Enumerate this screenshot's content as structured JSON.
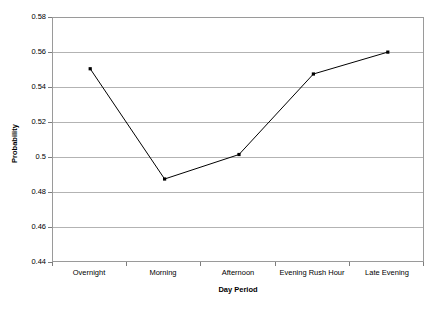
{
  "chart_data": {
    "type": "line",
    "title": "",
    "xlabel": "Day Period",
    "ylabel": "Probability",
    "categories": [
      "Overnight",
      "Morning",
      "Afternoon",
      "Evening Rush Hour",
      "Late Evening"
    ],
    "values": [
      0.551,
      0.488,
      0.502,
      0.548,
      0.5605
    ],
    "series": [
      {
        "name": "Probability",
        "values": [
          0.551,
          0.488,
          0.502,
          0.548,
          0.5605
        ]
      }
    ],
    "ylim": [
      0.44,
      0.58
    ],
    "ytick_step": 0.02,
    "ytick_labels": [
      "0.58",
      "0.56",
      "0.54",
      "0.52",
      "0.5",
      "0.48",
      "0.46",
      "0.44"
    ],
    "ytick_values": [
      0.58,
      0.56,
      0.54,
      0.52,
      0.5,
      0.48,
      0.46,
      0.44
    ],
    "grid": "horizontal",
    "legend": "none",
    "marker": "square",
    "line_color": "#000000",
    "marker_color": "#000000",
    "grid_color": "#b3b3b3",
    "frame_color": "#9a9a9a",
    "background_color": "#ffffff"
  }
}
